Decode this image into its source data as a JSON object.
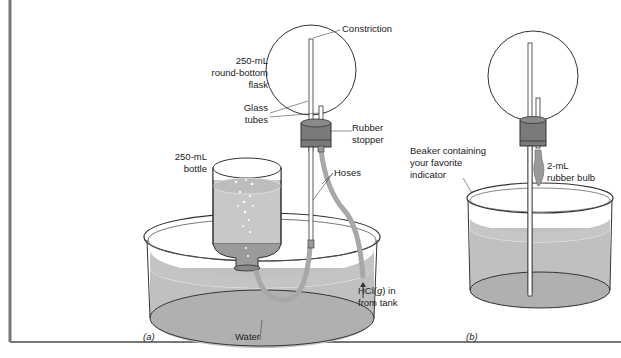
{
  "diagram": {
    "panels": [
      {
        "id": "a",
        "caption": "(a)",
        "labels": {
          "constriction": "Constriction",
          "flask_line1": "250-mL",
          "flask_line2": "round-bottom",
          "flask_line3": "flask",
          "tubes_line1": "Glass",
          "tubes_line2": "tubes",
          "stopper_line1": "Rubber",
          "stopper_line2": "stopper",
          "bottle_line1": "250-mL",
          "bottle_line2": "bottle",
          "hoses": "Hoses",
          "hcl_line1_pre": "HCl(",
          "hcl_line1_g": "g",
          "hcl_line1_post": ") in",
          "hcl_line2": "from tank",
          "water": "Water"
        }
      },
      {
        "id": "b",
        "caption": "(b)",
        "labels": {
          "beaker_line1": "Beaker containing",
          "beaker_line2": "your favorite",
          "beaker_line3": "indicator",
          "bulb_line1": "2-mL",
          "bulb_line2": "rubber bulb"
        }
      }
    ],
    "colors": {
      "liquid": "#b9b9b9",
      "stopper": "#7a7a7a",
      "hose": "#a8a8a8",
      "outline": "#333333",
      "frame": "#777777"
    }
  }
}
